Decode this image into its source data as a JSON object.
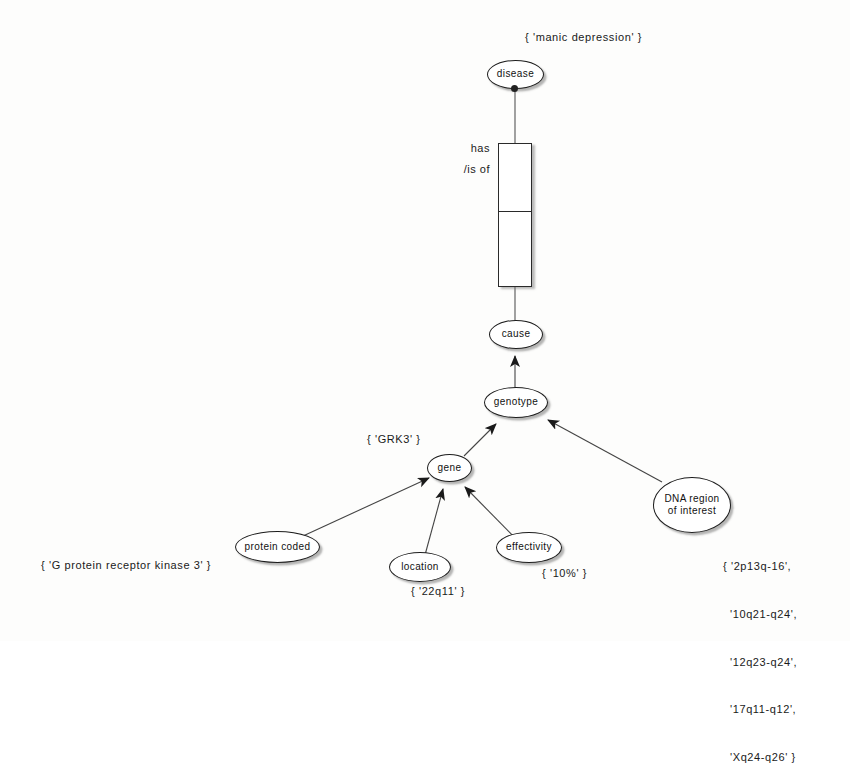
{
  "diagram": {
    "background": "#fdfdfc",
    "nodes": [
      {
        "id": "disease",
        "label": "disease"
      },
      {
        "id": "cause",
        "label": "cause"
      },
      {
        "id": "genotype",
        "label": "genotype"
      },
      {
        "id": "gene",
        "label": "gene"
      },
      {
        "id": "protein",
        "label": "protein coded"
      },
      {
        "id": "location",
        "label": "location"
      },
      {
        "id": "effectivity",
        "label": "effectivity"
      },
      {
        "id": "dna_line1",
        "label": "DNA region"
      },
      {
        "id": "dna_line2",
        "label": "of interest"
      }
    ],
    "relationship_box": {
      "label_line1": "has",
      "label_line2": "/is of"
    },
    "annotations": {
      "disease_value": "{ 'manic depression' }",
      "gene_value": "{ 'GRK3' }",
      "protein_value": "{ 'G protein receptor kinase 3' }",
      "location_value": "{ '22q11' }",
      "effectivity_value": "{ '10%' }",
      "dna_values": [
        "{ '2p13q-16',",
        "'10q21-q24',",
        "'12q23-q24',",
        "'17q11-q12',",
        "'Xq24-q26' }"
      ]
    },
    "edges": [
      {
        "from": "disease",
        "to": "relbox",
        "arrow": "none"
      },
      {
        "from": "relbox",
        "to": "cause",
        "arrow": "none"
      },
      {
        "from": "genotype",
        "to": "cause",
        "arrow": "filled-triangle"
      },
      {
        "from": "gene",
        "to": "genotype",
        "arrow": "filled-triangle"
      },
      {
        "from": "dna_region",
        "to": "genotype",
        "arrow": "filled-triangle"
      },
      {
        "from": "protein",
        "to": "gene",
        "arrow": "filled-triangle"
      },
      {
        "from": "location",
        "to": "gene",
        "arrow": "filled-triangle"
      },
      {
        "from": "effectivity",
        "to": "gene",
        "arrow": "filled-triangle"
      }
    ],
    "colors": {
      "stroke": "#1d1d1d",
      "fill": "#ffffff",
      "shadow": "#9a9a9a",
      "text": "#1a1a1a"
    }
  }
}
